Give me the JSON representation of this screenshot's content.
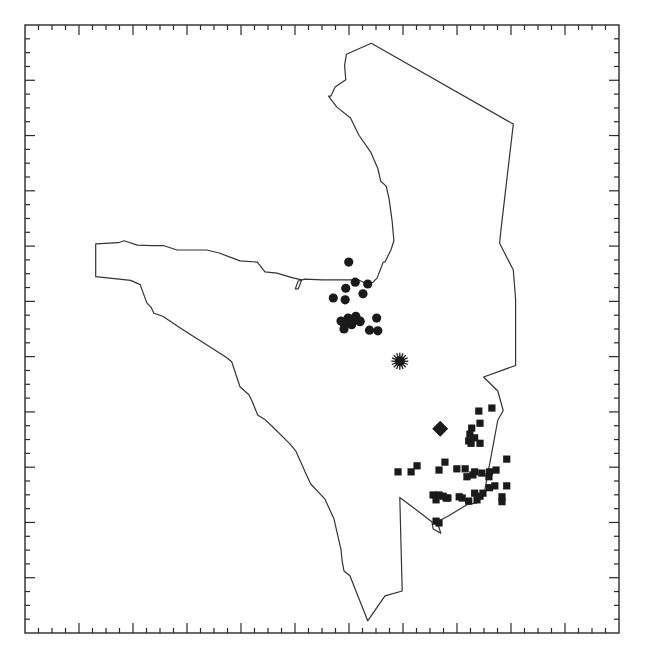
{
  "map": {
    "title": "",
    "frame": {
      "ticks": {
        "x_intervals": 44,
        "y_intervals": 44,
        "major_every": 4
      }
    },
    "region_outline": {
      "name": "study-region-boundary",
      "coords_normalized": [
        [
          0.583,
          0.03
        ],
        [
          0.541,
          0.048
        ],
        [
          0.538,
          0.067
        ],
        [
          0.54,
          0.09
        ],
        [
          0.522,
          0.102
        ],
        [
          0.515,
          0.117
        ],
        [
          0.511,
          0.117
        ],
        [
          0.525,
          0.135
        ],
        [
          0.548,
          0.153
        ],
        [
          0.562,
          0.181
        ],
        [
          0.582,
          0.209
        ],
        [
          0.594,
          0.236
        ],
        [
          0.599,
          0.257
        ],
        [
          0.608,
          0.265
        ],
        [
          0.613,
          0.286
        ],
        [
          0.618,
          0.322
        ],
        [
          0.621,
          0.355
        ],
        [
          0.616,
          0.37
        ],
        [
          0.611,
          0.38
        ],
        [
          0.606,
          0.39
        ],
        [
          0.603,
          0.39
        ],
        [
          0.598,
          0.403
        ],
        [
          0.593,
          0.416
        ],
        [
          0.586,
          0.423
        ],
        [
          0.576,
          0.426
        ],
        [
          0.561,
          0.419
        ],
        [
          0.538,
          0.419
        ],
        [
          0.5,
          0.419
        ],
        [
          0.471,
          0.418
        ],
        [
          0.46,
          0.421
        ],
        [
          0.455,
          0.434
        ],
        [
          0.46,
          0.434
        ],
        [
          0.466,
          0.419
        ],
        [
          0.451,
          0.416
        ],
        [
          0.424,
          0.408
        ],
        [
          0.404,
          0.406
        ],
        [
          0.391,
          0.39
        ],
        [
          0.362,
          0.388
        ],
        [
          0.327,
          0.375
        ],
        [
          0.306,
          0.37
        ],
        [
          0.256,
          0.37
        ],
        [
          0.234,
          0.363
        ],
        [
          0.214,
          0.363
        ],
        [
          0.189,
          0.362
        ],
        [
          0.167,
          0.355
        ],
        [
          0.157,
          0.358
        ],
        [
          0.119,
          0.36
        ],
        [
          0.119,
          0.414
        ],
        [
          0.178,
          0.42
        ],
        [
          0.194,
          0.427
        ],
        [
          0.205,
          0.457
        ],
        [
          0.212,
          0.464
        ],
        [
          0.217,
          0.474
        ],
        [
          0.232,
          0.479
        ],
        [
          0.264,
          0.5
        ],
        [
          0.338,
          0.546
        ],
        [
          0.338,
          0.546
        ],
        [
          0.348,
          0.554
        ],
        [
          0.362,
          0.595
        ],
        [
          0.377,
          0.608
        ],
        [
          0.382,
          0.618
        ],
        [
          0.392,
          0.642
        ],
        [
          0.404,
          0.649
        ],
        [
          0.416,
          0.66
        ],
        [
          0.446,
          0.689
        ],
        [
          0.456,
          0.701
        ],
        [
          0.468,
          0.727
        ],
        [
          0.471,
          0.734
        ],
        [
          0.481,
          0.755
        ],
        [
          0.505,
          0.78
        ],
        [
          0.52,
          0.812
        ],
        [
          0.532,
          0.863
        ],
        [
          0.534,
          0.882
        ],
        [
          0.537,
          0.898
        ],
        [
          0.547,
          0.906
        ],
        [
          0.577,
          0.98
        ],
        [
          0.606,
          0.939
        ],
        [
          0.635,
          0.931
        ],
        [
          0.631,
          0.777
        ],
        [
          0.685,
          0.817
        ],
        [
          0.687,
          0.829
        ],
        [
          0.7,
          0.836
        ],
        [
          0.694,
          0.817
        ],
        [
          0.712,
          0.808
        ],
        [
          0.744,
          0.789
        ],
        [
          0.761,
          0.786
        ],
        [
          0.774,
          0.765
        ],
        [
          0.796,
          0.65
        ],
        [
          0.805,
          0.634
        ],
        [
          0.796,
          0.602
        ],
        [
          0.772,
          0.579
        ],
        [
          0.826,
          0.56
        ],
        [
          0.826,
          0.51
        ],
        [
          0.826,
          0.451
        ],
        [
          0.822,
          0.403
        ],
        [
          0.799,
          0.359
        ],
        [
          0.801,
          0.339
        ],
        [
          0.822,
          0.163
        ],
        [
          0.583,
          0.03
        ]
      ]
    },
    "markers": {
      "circles": {
        "symbol": "filled-circle",
        "points_normalized": [
          [
            0.545,
            0.39
          ],
          [
            0.556,
            0.423
          ],
          [
            0.54,
            0.433
          ],
          [
            0.577,
            0.426
          ],
          [
            0.519,
            0.449
          ],
          [
            0.539,
            0.452
          ],
          [
            0.569,
            0.442
          ],
          [
            0.532,
            0.487
          ],
          [
            0.544,
            0.482
          ],
          [
            0.551,
            0.484
          ],
          [
            0.557,
            0.479
          ],
          [
            0.564,
            0.487
          ],
          [
            0.538,
            0.493
          ],
          [
            0.537,
            0.5
          ],
          [
            0.55,
            0.493
          ],
          [
            0.592,
            0.482
          ],
          [
            0.58,
            0.502
          ],
          [
            0.594,
            0.503
          ],
          [
            0.564,
            0.488
          ]
        ]
      },
      "squares": {
        "symbol": "filled-square",
        "points_normalized": [
          [
            0.764,
            0.635
          ],
          [
            0.786,
            0.63
          ],
          [
            0.766,
            0.655
          ],
          [
            0.752,
            0.663
          ],
          [
            0.749,
            0.673
          ],
          [
            0.747,
            0.684
          ],
          [
            0.757,
            0.679
          ],
          [
            0.751,
            0.688
          ],
          [
            0.766,
            0.688
          ],
          [
            0.811,
            0.714
          ],
          [
            0.707,
            0.719
          ],
          [
            0.66,
            0.725
          ],
          [
            0.65,
            0.735
          ],
          [
            0.628,
            0.735
          ],
          [
            0.697,
            0.732
          ],
          [
            0.727,
            0.73
          ],
          [
            0.741,
            0.73
          ],
          [
            0.754,
            0.74
          ],
          [
            0.744,
            0.743
          ],
          [
            0.757,
            0.735
          ],
          [
            0.769,
            0.737
          ],
          [
            0.782,
            0.735
          ],
          [
            0.781,
            0.743
          ],
          [
            0.793,
            0.732
          ],
          [
            0.791,
            0.758
          ],
          [
            0.811,
            0.758
          ],
          [
            0.782,
            0.761
          ],
          [
            0.771,
            0.77
          ],
          [
            0.761,
            0.781
          ],
          [
            0.757,
            0.77
          ],
          [
            0.731,
            0.776
          ],
          [
            0.709,
            0.778
          ],
          [
            0.697,
            0.773
          ],
          [
            0.687,
            0.773
          ],
          [
            0.692,
            0.781
          ],
          [
            0.704,
            0.775
          ],
          [
            0.712,
            0.778
          ],
          [
            0.736,
            0.778
          ],
          [
            0.747,
            0.783
          ],
          [
            0.766,
            0.775
          ],
          [
            0.803,
            0.776
          ],
          [
            0.803,
            0.784
          ],
          [
            0.692,
            0.816
          ],
          [
            0.697,
            0.819
          ]
        ]
      },
      "star": {
        "symbol": "sunburst",
        "point_normalized": [
          0.631,
          0.553
        ]
      },
      "diamond": {
        "symbol": "filled-diamond",
        "point_normalized": [
          0.699,
          0.664
        ]
      }
    },
    "colors": {
      "ink": "#1a1a1a",
      "outline": "#333333",
      "background": "#ffffff"
    }
  }
}
